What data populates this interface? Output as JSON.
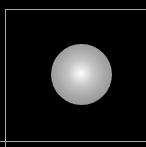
{
  "scene": {
    "background_color": "#000000",
    "frame": {
      "line_color": "#a8a8a8",
      "lines": [
        "left",
        "top",
        "bottom"
      ]
    },
    "sphere": {
      "shape": "shaded-sphere",
      "center": [
        81,
        74
      ],
      "diameter": 61,
      "highlight_color": "#ffffff",
      "edge_color": "#878787"
    }
  }
}
